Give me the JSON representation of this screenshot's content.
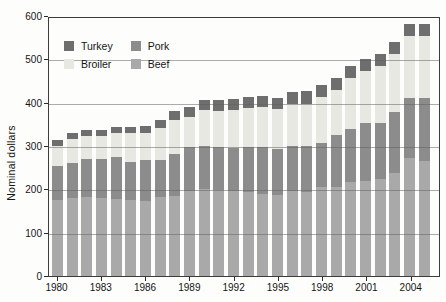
{
  "chart_data": {
    "type": "bar",
    "stacked": true,
    "title": "",
    "xlabel": "",
    "ylabel": "Nominal dollars",
    "ylim": [
      0,
      600
    ],
    "yticks": [
      0,
      100,
      200,
      300,
      400,
      500,
      600
    ],
    "grid": true,
    "categories": [
      1980,
      1981,
      1982,
      1983,
      1984,
      1985,
      1986,
      1987,
      1988,
      1989,
      1990,
      1991,
      1992,
      1993,
      1994,
      1995,
      1996,
      1997,
      1998,
      1999,
      2000,
      2001,
      2002,
      2003,
      2004,
      2005
    ],
    "xtick_labels": [
      "1980",
      "1983",
      "1986",
      "1989",
      "1992",
      "1995",
      "1998",
      "2001",
      "2004"
    ],
    "xtick_every": 3,
    "series": [
      {
        "name": "Beef",
        "color": "#a9a9a9",
        "values": [
          175,
          180,
          183,
          180,
          178,
          175,
          174,
          182,
          185,
          197,
          201,
          199,
          196,
          195,
          189,
          187,
          197,
          195,
          205,
          205,
          216,
          220,
          224,
          238,
          272,
          266
        ]
      },
      {
        "name": "Pork",
        "color": "#8c8c8c",
        "values": [
          80,
          80,
          87,
          91,
          96,
          89,
          94,
          86,
          96,
          100,
          100,
          98,
          99,
          102,
          108,
          106,
          102,
          105,
          103,
          120,
          124,
          134,
          128,
          140,
          139,
          145
        ]
      },
      {
        "name": "Broiler",
        "color": "#e8e8e3",
        "values": [
          46,
          56,
          54,
          53,
          57,
          66,
          61,
          73,
          78,
          69,
          81,
          85,
          89,
          90,
          92,
          92,
          98,
          98,
          104,
          104,
          118,
          120,
          133,
          134,
          143,
          143
        ]
      },
      {
        "name": "Turkey",
        "color": "#6e6e6e",
        "values": [
          12,
          13,
          13,
          14,
          14,
          14,
          18,
          20,
          23,
          23,
          25,
          25,
          24,
          25,
          26,
          25,
          27,
          28,
          29,
          29,
          27,
          27,
          27,
          27,
          27,
          27
        ]
      }
    ],
    "legend": {
      "position": "top-left",
      "order": [
        "Turkey",
        "Pork",
        "Broiler",
        "Beef"
      ]
    },
    "colors": {
      "axis": "#3c3c3c",
      "gridline": "#9a9a9a",
      "background": "#fdfdfb",
      "text": "#151515"
    }
  }
}
